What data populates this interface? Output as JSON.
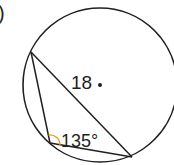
{
  "problem": {
    "label_fragment": ")",
    "center_label": "18",
    "angle_label": "135°"
  },
  "colors": {
    "stroke": "#231f20",
    "angle_arc": "#f7941d",
    "background": "#ffffff"
  }
}
